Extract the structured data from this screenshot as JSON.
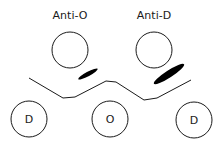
{
  "diagram": {
    "title": "",
    "antisera_wells": [
      {
        "label": "Anti-O",
        "cx": 70,
        "cy": 50,
        "r": 18,
        "label_x": 70,
        "label_y": 19
      },
      {
        "label": "Anti-D",
        "cx": 154,
        "cy": 50,
        "r": 18,
        "label_x": 154,
        "label_y": 19
      }
    ],
    "antigen_wells": [
      {
        "label": "D",
        "cx": 29,
        "cy": 119,
        "r": 18
      },
      {
        "label": "O",
        "cx": 110,
        "cy": 119,
        "r": 18
      },
      {
        "label": "D",
        "cx": 194,
        "cy": 120,
        "r": 18
      }
    ],
    "precipitin_line_points": "29,78 63,98 75,97 106,81 116,82 144,100 157,98 191,80",
    "precipitin_arcs": [
      {
        "name": "small-arc",
        "cx": 88,
        "cy": 74,
        "rx": 11,
        "ry": 2.2,
        "angle": -28
      },
      {
        "name": "large-arc",
        "cx": 169,
        "cy": 74,
        "rx": 18,
        "ry": 3.5,
        "angle": -33
      }
    ],
    "colors": {
      "stroke": "#1a1a1a",
      "fill": "#000000",
      "background": "#ffffff"
    }
  }
}
